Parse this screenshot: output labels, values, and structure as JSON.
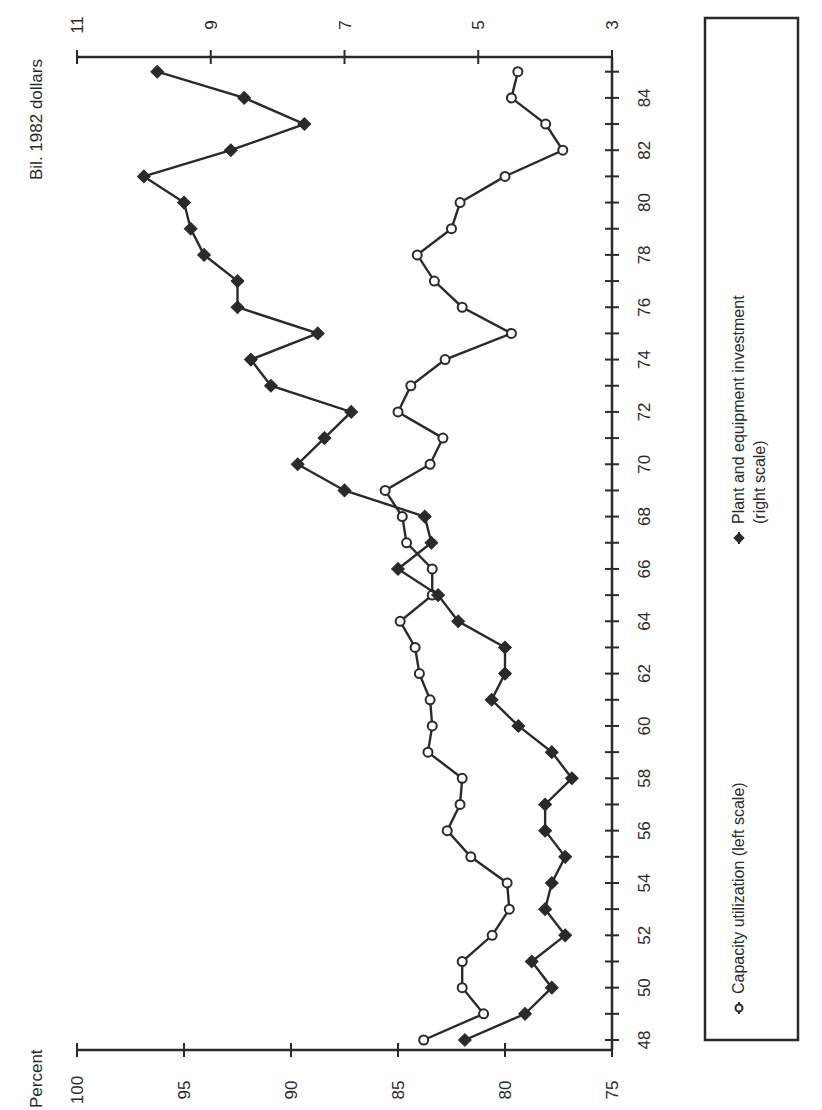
{
  "chart_data": {
    "type": "line",
    "orientation": "rotated 90° counter-clockwise (years run bottom-to-top)",
    "title": "",
    "xlabel": "",
    "left_axis": {
      "label": "Percent",
      "ticks": [
        100,
        95,
        90,
        85,
        80,
        75
      ],
      "range": [
        75,
        100
      ]
    },
    "right_axis": {
      "label": "Bil. 1982 dollars",
      "ticks": [
        11,
        9,
        7,
        5,
        3
      ],
      "range": [
        3,
        11
      ]
    },
    "year_ticks": [
      "48",
      "50",
      "52",
      "54",
      "56",
      "58",
      "60",
      "62",
      "64",
      "66",
      "68",
      "70",
      "72",
      "74",
      "76",
      "78",
      "80",
      "82",
      "84"
    ],
    "x": [
      48,
      49,
      50,
      51,
      52,
      53,
      54,
      55,
      56,
      57,
      58,
      59,
      60,
      61,
      62,
      63,
      64,
      65,
      66,
      67,
      68,
      69,
      70,
      71,
      72,
      73,
      74,
      75,
      76,
      77,
      78,
      79,
      80,
      81,
      82,
      83,
      84,
      85
    ],
    "series": [
      {
        "name": "Capacity utilization (left scale)",
        "axis": "left",
        "marker": "open-circle",
        "values": [
          83.8,
          81.0,
          82.0,
          82.0,
          80.6,
          79.8,
          79.9,
          81.6,
          82.7,
          82.1,
          82.0,
          83.6,
          83.4,
          83.5,
          84.0,
          84.2,
          84.9,
          83.4,
          83.4,
          84.6,
          84.8,
          85.6,
          83.5,
          82.9,
          85.0,
          84.4,
          82.8,
          79.7,
          82.0,
          83.3,
          84.1,
          82.5,
          82.1,
          80.0,
          77.3,
          78.1,
          79.7,
          79.4
        ]
      },
      {
        "name": "Plant and equipment investment (right scale)",
        "axis": "right",
        "marker": "filled-diamond",
        "values": [
          5.2,
          4.3,
          3.9,
          4.2,
          3.7,
          4.0,
          3.9,
          3.7,
          4.0,
          4.0,
          3.6,
          3.9,
          4.4,
          4.8,
          4.6,
          4.6,
          5.3,
          5.6,
          6.2,
          5.7,
          5.8,
          7.0,
          7.7,
          7.3,
          6.9,
          8.1,
          8.4,
          7.4,
          8.6,
          8.6,
          9.1,
          9.3,
          9.4,
          10.0,
          8.7,
          7.6,
          8.5,
          9.8
        ]
      }
    ],
    "grid": false,
    "legend_position": "right side (bottom of chart when unrotated)"
  },
  "legend": {
    "capacity_label": "Capacity utilization (left scale)",
    "investment_label_line1": "Plant and equipment investment",
    "investment_label_line2": "(right scale)"
  },
  "colors": {
    "ink": "#2a2a2a",
    "background": "#ffffff"
  }
}
